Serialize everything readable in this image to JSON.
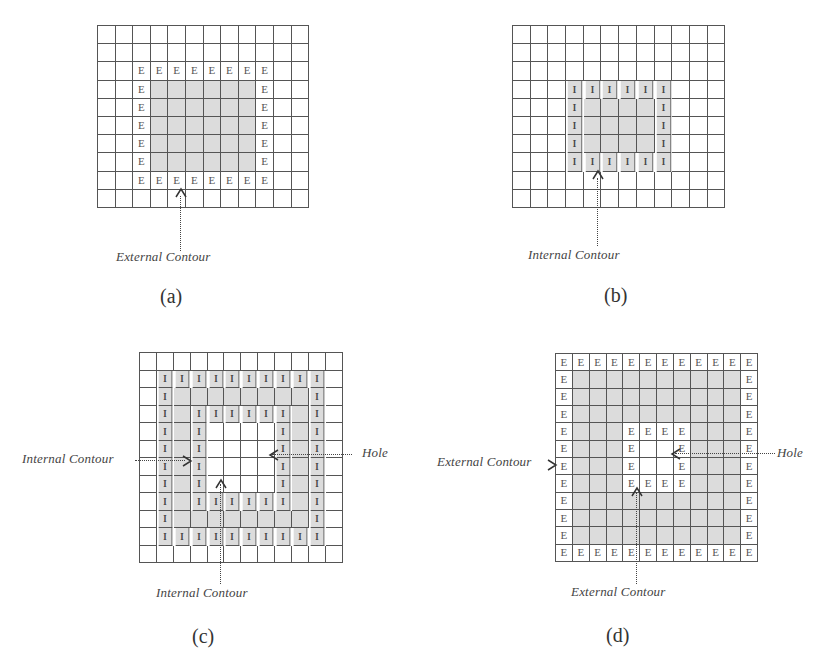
{
  "figure": {
    "panels": [
      {
        "id": "a",
        "subcaption": "(a)",
        "grid": {
          "x": 97,
          "y": 25,
          "cols": 12,
          "rows": 10,
          "cellW": 17.6,
          "cellH": 18.2
        },
        "gray_cells": {
          "rows": [
            3,
            7
          ],
          "cols": [
            3,
            8
          ],
          "holes": []
        },
        "label_letter": "E",
        "label_cells": "ring:r2-8,c2-9",
        "annotations": [
          {
            "text": "External Contour",
            "type": "up-arrow",
            "targetCol": 4.7,
            "targetRow": 9
          }
        ]
      },
      {
        "id": "b",
        "subcaption": "(b)",
        "grid": {
          "x": 512,
          "y": 25,
          "cols": 12,
          "rows": 10,
          "cellW": 17.7,
          "cellH": 18.2
        },
        "gray_cells": {
          "rows": [
            3,
            7
          ],
          "cols": [
            3,
            8
          ],
          "holes": []
        },
        "label_letter": "I",
        "label_cells": "ring:r3-7,c3-8",
        "annotations": [
          {
            "text": "Internal Contour",
            "type": "up-arrow",
            "targetCol": 4.9,
            "targetRow": 8
          }
        ]
      },
      {
        "id": "c",
        "subcaption": "(c)",
        "grid": {
          "x": 139,
          "y": 352,
          "cols": 12,
          "rows": 12,
          "cellW": 16.9,
          "cellH": 17.5
        },
        "gray_cells": {
          "rows": [
            1,
            10
          ],
          "cols": [
            1,
            10
          ],
          "holes": [
            [
              4,
              7,
              4,
              7
            ]
          ]
        },
        "label_letter": "I",
        "label_cells": "ring:r1-10,c1-10;ring:r3-8,c3-8",
        "annotations": [
          {
            "text": "Internal Contour",
            "type": "right-arrow",
            "side": "left"
          },
          {
            "text": "Hole",
            "type": "left-arrow",
            "side": "right"
          },
          {
            "text": "Internal Contour",
            "type": "up-arrow"
          }
        ]
      },
      {
        "id": "d",
        "subcaption": "(d)",
        "grid": {
          "x": 555,
          "y": 353,
          "cols": 12,
          "rows": 12,
          "cellW": 16.85,
          "cellH": 17.35
        },
        "gray_cells": {
          "rows": [
            1,
            10
          ],
          "cols": [
            1,
            10
          ],
          "holes": [
            [
              4,
              7,
              4,
              7
            ]
          ]
        },
        "label_letter": "E",
        "label_cells": "ring:r0-11,c0-11;ring:r4-7,c4-7",
        "annotations": [
          {
            "text": "External Contour",
            "type": "right-arrow",
            "side": "left"
          },
          {
            "text": "Hole",
            "type": "left-arrow",
            "side": "right"
          },
          {
            "text": "External Contour",
            "type": "up-arrow"
          }
        ]
      }
    ],
    "captions": {
      "a_bottom": "External Contour",
      "b_bottom": "Internal Contour",
      "c_left": "Internal Contour",
      "c_right": "Hole",
      "c_bottom": "Internal Contour",
      "d_left": "External Contour",
      "d_right": "Hole",
      "d_bottom": "External Contour"
    },
    "subcaptions": {
      "a": "(a)",
      "b": "(b)",
      "c": "(c)",
      "d": "(d)"
    },
    "colors": {
      "gray_fill": "#dcdcdc",
      "grid_line": "#555555",
      "text": "#444444"
    }
  }
}
